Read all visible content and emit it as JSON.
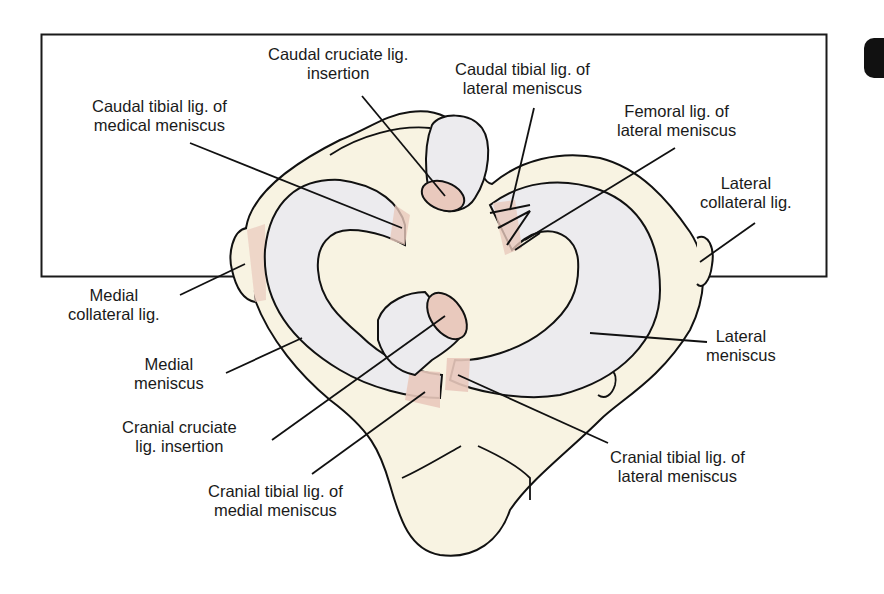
{
  "figure": {
    "colors": {
      "bone": "#f8f3e2",
      "meniscus": "#ecebee",
      "ligament": "#e9c9bd",
      "outline": "#111111",
      "frame": "#1a1a1a",
      "background": "#ffffff"
    }
  },
  "labels": {
    "caudal_cruciate": {
      "line1": "Caudal cruciate lig.",
      "line2": "insertion"
    },
    "caudal_tibial_lateral": {
      "line1": "Caudal tibial lig. of",
      "line2": "lateral meniscus"
    },
    "caudal_tibial_medial": {
      "line1": "Caudal tibial lig. of",
      "line2": "medical meniscus"
    },
    "femoral_lateral": {
      "line1": "Femoral lig. of",
      "line2": "lateral meniscus"
    },
    "lateral_collateral": {
      "line1": "Lateral",
      "line2": "collateral lig."
    },
    "medial_collateral": {
      "line1": "Medial",
      "line2": "collateral lig."
    },
    "lateral_meniscus": {
      "line1": "Lateral",
      "line2": "meniscus"
    },
    "medial_meniscus": {
      "line1": "Medial",
      "line2": "meniscus"
    },
    "cranial_cruciate": {
      "line1": "Cranial cruciate",
      "line2": "lig. insertion"
    },
    "cranial_tibial_lateral": {
      "line1": "Cranial tibial lig. of",
      "line2": "lateral meniscus"
    },
    "cranial_tibial_medial": {
      "line1": "Cranial tibial lig. of",
      "line2": "medial meniscus"
    }
  }
}
